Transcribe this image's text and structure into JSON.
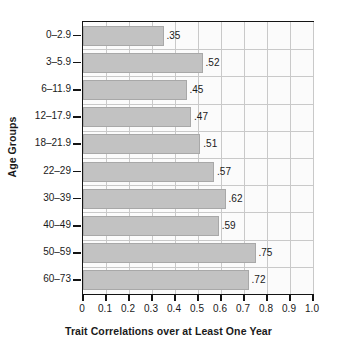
{
  "chart_data": {
    "type": "bar",
    "orientation": "horizontal",
    "title": "",
    "xlabel": "Trait Correlations over at Least One Year",
    "ylabel": "Age Groups",
    "categories": [
      "0–2.9",
      "3–5.9",
      "6–11.9",
      "12–17.9",
      "18–21.9",
      "22–29",
      "30–39",
      "40–49",
      "50–59",
      "60–73"
    ],
    "values": [
      0.35,
      0.52,
      0.45,
      0.47,
      0.51,
      0.57,
      0.62,
      0.59,
      0.75,
      0.72
    ],
    "value_labels": [
      ".35",
      ".52",
      ".45",
      ".47",
      ".51",
      ".57",
      ".62",
      ".59",
      ".75",
      ".72"
    ],
    "xlim": [
      0,
      1.0
    ],
    "xticks": [
      0,
      0.1,
      0.2,
      0.3,
      0.4,
      0.5,
      0.6,
      0.7,
      0.8,
      0.9,
      1.0
    ],
    "xtick_labels": [
      "0",
      "0.1",
      "0.2",
      "0.3",
      "0.4",
      "0.5",
      "0.6",
      "0.7",
      "0.8",
      "0.9",
      "1.0"
    ],
    "grid": true,
    "legend": null,
    "colors": {
      "bar_fill": "#c2c2c2",
      "bar_stroke": "#a8a8a8",
      "plot_background": "#fbfbfb",
      "gridline": "#c9c9c9",
      "axis": "#141414",
      "text": "#1a1a1a",
      "page_background": "#ffffff"
    }
  }
}
